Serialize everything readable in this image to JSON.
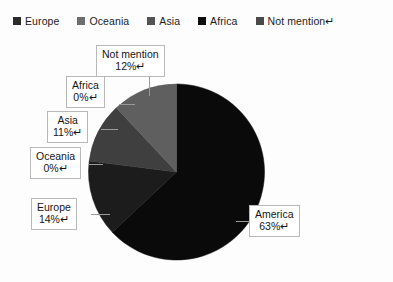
{
  "chart_data": {
    "type": "pie",
    "title": "",
    "categories": [
      "Europe",
      "Oceania",
      "Asia",
      "Africa",
      "Not mention",
      "America"
    ],
    "values": [
      14,
      0,
      11,
      0,
      12,
      63
    ],
    "unit": "%",
    "legend_position": "top",
    "grid": false,
    "slice_colors": [
      "#1c1c1c",
      "#6f6f6f",
      "#3f3f3f",
      "#111111",
      "#5f5f5f",
      "#0a0a0a"
    ],
    "data_labels": [
      {
        "category": "Not mention",
        "value": "12%↵"
      },
      {
        "category": "Africa",
        "value": "0%↵"
      },
      {
        "category": "Asia",
        "value": "11%↵"
      },
      {
        "category": "Oceania",
        "value": "0%↵"
      },
      {
        "category": "Europe",
        "value": "14%↵"
      },
      {
        "category": "America",
        "value": "63%↵"
      }
    ]
  },
  "legend": {
    "items": [
      {
        "label": "Europe",
        "color": "#2b2b2b"
      },
      {
        "label": "Oceania",
        "color": "#6e6e6e"
      },
      {
        "label": "Asia",
        "color": "#545454"
      },
      {
        "label": "Africa",
        "color": "#0e0e0e"
      },
      {
        "label": "Not mention↵",
        "color": "#4a4a4a"
      }
    ]
  },
  "callouts": {
    "not_mention": {
      "category": "Not mention",
      "value": "12%↵"
    },
    "africa": {
      "category": "Africa",
      "value": "0%↵"
    },
    "asia": {
      "category": "Asia",
      "value": "11%↵"
    },
    "oceania": {
      "category": "Oceania",
      "value": "0%↵"
    },
    "europe": {
      "category": "Europe",
      "value": "14%↵"
    },
    "america": {
      "category": "America",
      "value": "63%↵"
    }
  },
  "colors": {
    "background": "#fdfdfd",
    "callout_border": "#b8b8b8",
    "leader_line": "#9a9a9a",
    "text": "#151515"
  }
}
